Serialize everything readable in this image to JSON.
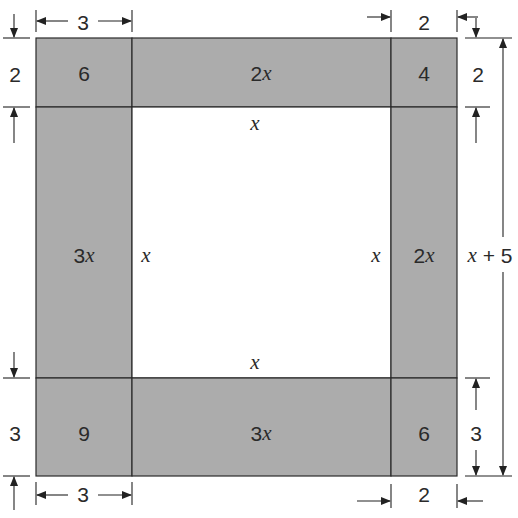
{
  "diagram": {
    "title": "",
    "colors": {
      "region_fill": "#acacac",
      "inner_fill": "#ffffff",
      "line": "#2a2a2a"
    },
    "regions": {
      "top_left": "6",
      "top_middle": "2x",
      "top_right": "4",
      "middle_left": "3x",
      "middle_right": "2x",
      "bottom_left": "9",
      "bottom_middle": "3x",
      "bottom_right": "6"
    },
    "inner_square_labels": {
      "top": "x",
      "bottom": "x",
      "left": "x",
      "right": "x"
    },
    "dimensions": {
      "top_left_width": "3",
      "top_right_width": "2",
      "bottom_left_width": "3",
      "bottom_right_width": "2",
      "left_top_height": "2",
      "left_bottom_height": "3",
      "right_top_height": "2",
      "right_bottom_height": "3",
      "right_total_height": "x + 5"
    }
  }
}
